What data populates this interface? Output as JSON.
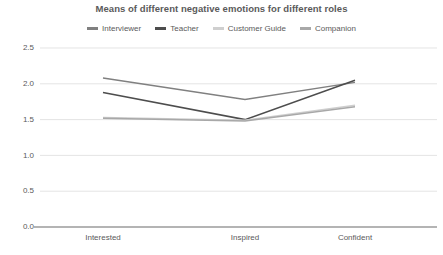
{
  "chart_data": {
    "type": "line",
    "title": "Means of different negative emotions for different roles",
    "xlabel": "",
    "ylabel": "",
    "categories": [
      "Interested",
      "Inspired",
      "Confident"
    ],
    "ylim": [
      0.0,
      2.5
    ],
    "yticks": [
      "0.0",
      "0.5",
      "1.0",
      "1.5",
      "2.0",
      "2.5"
    ],
    "ytick_values": [
      0.0,
      0.5,
      1.0,
      1.5,
      2.0,
      2.5
    ],
    "grid": true,
    "legend_position": "top-center",
    "series": [
      {
        "name": "Interviewer",
        "color": "#808080",
        "values": [
          2.08,
          1.78,
          2.02
        ]
      },
      {
        "name": "Teacher",
        "color": "#4d4d4d",
        "values": [
          1.88,
          1.5,
          2.05
        ]
      },
      {
        "name": "Customer Guide",
        "color": "#cfcfcf",
        "values": [
          1.53,
          1.49,
          1.7
        ]
      },
      {
        "name": "Companion",
        "color": "#a8a8a8",
        "values": [
          1.52,
          1.48,
          1.68
        ]
      }
    ]
  },
  "colors": {
    "background": "#ffffff",
    "text": "#5a5a5a",
    "gridline": "#d9d9d9",
    "axis": "#6b6b6b"
  }
}
